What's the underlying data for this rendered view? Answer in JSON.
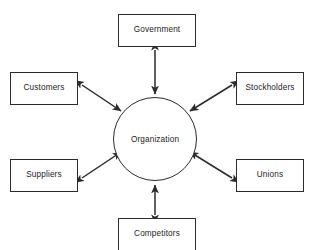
{
  "diagram": {
    "type": "hub-and-spoke",
    "center": {
      "label": "Organization",
      "shape": "circle"
    },
    "nodes": [
      {
        "id": "government",
        "label": "Government",
        "position": "top"
      },
      {
        "id": "customers",
        "label": "Customers",
        "position": "upper-left"
      },
      {
        "id": "stockholders",
        "label": "Stockholders",
        "position": "upper-right"
      },
      {
        "id": "suppliers",
        "label": "Suppliers",
        "position": "lower-left"
      },
      {
        "id": "unions",
        "label": "Unions",
        "position": "lower-right"
      },
      {
        "id": "competitors",
        "label": "Competitors",
        "position": "bottom"
      }
    ],
    "connectors": [
      {
        "from": "center",
        "to": "government",
        "style": "double-arrow"
      },
      {
        "from": "center",
        "to": "customers",
        "style": "double-arrow"
      },
      {
        "from": "center",
        "to": "stockholders",
        "style": "double-arrow"
      },
      {
        "from": "center",
        "to": "suppliers",
        "style": "double-arrow"
      },
      {
        "from": "center",
        "to": "unions",
        "style": "double-arrow"
      },
      {
        "from": "center",
        "to": "competitors",
        "style": "double-arrow"
      }
    ],
    "colors": {
      "background": "#ffffff",
      "stroke": "#2b2b2b",
      "text": "#1c1c1c",
      "fill": "#ffffff"
    }
  }
}
